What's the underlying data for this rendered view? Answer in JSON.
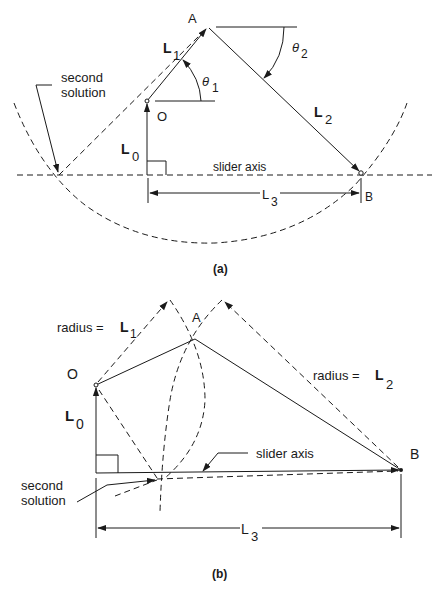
{
  "figure_a": {
    "caption": "(a)",
    "labels": {
      "point_A": "A",
      "point_O": "O",
      "point_B": "B",
      "L1": "L",
      "L1_sub": "1",
      "L2": "L",
      "L2_sub": "2",
      "L0": "L",
      "L0_sub": "0",
      "L3": "L",
      "L3_sub": "3",
      "theta1": "θ",
      "theta1_sub": "1",
      "theta2": "θ",
      "theta2_sub": "2",
      "second_solution_line1": "second",
      "second_solution_line2": "solution",
      "slider_axis": "slider axis"
    }
  },
  "figure_b": {
    "caption": "(b)",
    "labels": {
      "point_A": "A",
      "point_O": "O",
      "point_B": "B",
      "radius_L1": "radius = ",
      "radius_L1_sym": "L",
      "radius_L1_sub": "1",
      "radius_L2": "radius = ",
      "radius_L2_sym": "L",
      "radius_L2_sub": "2",
      "L0": "L",
      "L0_sub": "0",
      "L3": "L",
      "L3_sub": "3",
      "second_solution_line1": "second",
      "second_solution_line2": "solution",
      "slider_axis": "slider axis"
    }
  },
  "colors": {
    "ink": "#1a1a1a",
    "background": "#ffffff"
  }
}
